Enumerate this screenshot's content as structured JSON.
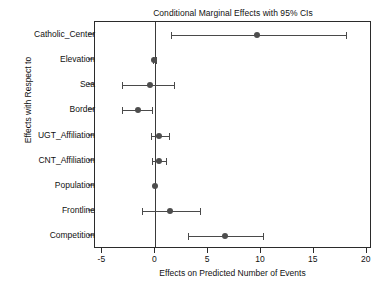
{
  "chart_data": {
    "type": "scatter",
    "title": "Conditional Marginal Effects with 95% CIs",
    "xlabel": "Effects on Predicted Number of Events",
    "ylabel": "Effects with Respect to",
    "xlim": [
      -5.7,
      20.5
    ],
    "xticks": [
      -5,
      0,
      5,
      10,
      15,
      20
    ],
    "xticklabels": [
      "-5",
      "0",
      "5",
      "10",
      "15",
      "20"
    ],
    "grid": false,
    "legend": null,
    "reference_line_x": 0,
    "categories": [
      "Catholic_Center",
      "Elevation",
      "Sea",
      "Border",
      "UGT_Affiliation",
      "CNT_Affiliation",
      "Population",
      "Frontline",
      "Competition"
    ],
    "points": [
      {
        "label": "Catholic_Center",
        "estimate": 9.6,
        "ci_low": 1.5,
        "ci_high": 18.0
      },
      {
        "label": "Elevation",
        "estimate": -0.1,
        "ci_low": -0.2,
        "ci_high": 0.1
      },
      {
        "label": "Sea",
        "estimate": -0.5,
        "ci_low": -3.1,
        "ci_high": 1.8
      },
      {
        "label": "Border",
        "estimate": -1.6,
        "ci_low": -3.1,
        "ci_high": -0.3
      },
      {
        "label": "UGT_Affiliation",
        "estimate": 0.4,
        "ci_low": -0.4,
        "ci_high": 1.3
      },
      {
        "label": "CNT_Affiliation",
        "estimate": 0.4,
        "ci_low": -0.3,
        "ci_high": 1.0
      },
      {
        "label": "Population",
        "estimate": 0.0,
        "ci_low": -0.1,
        "ci_high": 0.1
      },
      {
        "label": "Frontline",
        "estimate": 1.4,
        "ci_low": -1.3,
        "ci_high": 4.2
      },
      {
        "label": "Competition",
        "estimate": 6.6,
        "ci_low": 3.1,
        "ci_high": 10.2
      }
    ],
    "colors": {
      "point": "#4d4d4d",
      "ci": "#4a4a4a",
      "axis": "#2b2b2b",
      "reference_line": "#3a3a3a",
      "background": "#ffffff"
    }
  }
}
